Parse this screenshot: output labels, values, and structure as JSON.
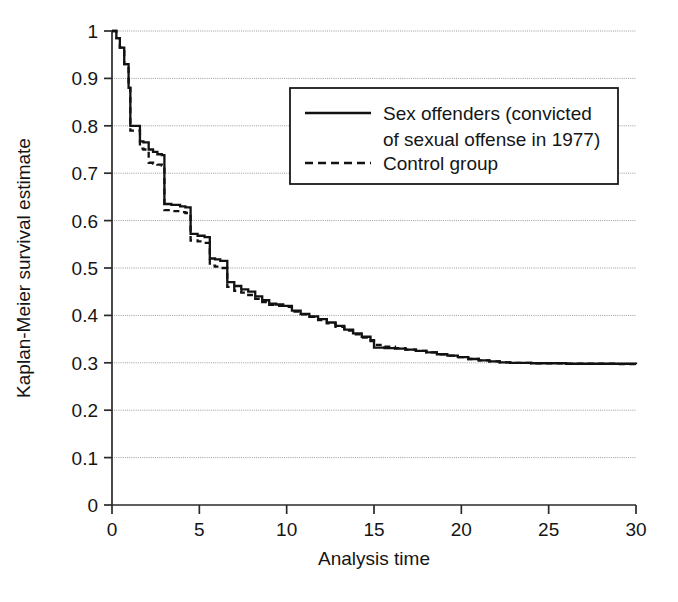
{
  "chart_data": {
    "type": "line",
    "title": "",
    "subtitle": "",
    "xlabel": "Analysis time",
    "ylabel": "Kaplan-Meier survival estimate",
    "xlim": [
      0,
      30
    ],
    "ylim": [
      0,
      1
    ],
    "xticks": [
      "0",
      "5",
      "10",
      "15",
      "20",
      "25",
      "30"
    ],
    "xtick_values": [
      0,
      5,
      10,
      15,
      20,
      25,
      30
    ],
    "yticks": [
      "0",
      "0.1",
      "0.2",
      "0.3",
      "0.4",
      "0.5",
      "0.6",
      "0.7",
      "0.8",
      "0.9",
      "1"
    ],
    "ytick_values": [
      0,
      0.1,
      0.2,
      0.3,
      0.4,
      0.5,
      0.6,
      0.7,
      0.8,
      0.9,
      1.0
    ],
    "grid": true,
    "grid_axis": "y",
    "legend_position": "upper-right-inside",
    "step_type": "post",
    "series": [
      {
        "name": "Sex offenders (convicted of sexual offense in 1977)",
        "style": "solid",
        "x": [
          0,
          0.25,
          0.45,
          0.7,
          0.95,
          1.05,
          1.6,
          1.8,
          2.1,
          2.35,
          2.6,
          2.85,
          3.0,
          3.4,
          3.9,
          4.2,
          4.5,
          4.9,
          5.3,
          5.6,
          5.9,
          6.2,
          6.6,
          7.0,
          7.4,
          7.8,
          8.2,
          8.6,
          9.0,
          9.4,
          9.8,
          10.3,
          10.8,
          11.3,
          11.8,
          12.3,
          12.8,
          13.3,
          13.8,
          14.3,
          14.8,
          15.0,
          15.6,
          16.2,
          16.8,
          17.4,
          18.0,
          18.6,
          19.2,
          19.8,
          20.4,
          21.0,
          21.6,
          22.2,
          22.8,
          23.4,
          24.0,
          25.0,
          26.0,
          27.0,
          28.0,
          29.0,
          30.0
        ],
        "y": [
          1.0,
          0.985,
          0.965,
          0.93,
          0.88,
          0.8,
          0.767,
          0.765,
          0.75,
          0.745,
          0.74,
          0.738,
          0.635,
          0.633,
          0.63,
          0.628,
          0.572,
          0.568,
          0.565,
          0.52,
          0.518,
          0.515,
          0.47,
          0.462,
          0.455,
          0.45,
          0.44,
          0.432,
          0.425,
          0.423,
          0.42,
          0.41,
          0.403,
          0.398,
          0.392,
          0.385,
          0.378,
          0.37,
          0.362,
          0.355,
          0.348,
          0.332,
          0.331,
          0.33,
          0.328,
          0.325,
          0.322,
          0.318,
          0.315,
          0.312,
          0.308,
          0.305,
          0.303,
          0.301,
          0.3,
          0.3,
          0.299,
          0.299,
          0.298,
          0.298,
          0.298,
          0.298,
          0.297
        ]
      },
      {
        "name": "Control group",
        "style": "dashed",
        "x": [
          0,
          0.25,
          0.45,
          0.7,
          0.95,
          1.05,
          1.6,
          1.8,
          2.1,
          2.35,
          2.6,
          2.85,
          3.0,
          3.4,
          3.9,
          4.2,
          4.5,
          4.9,
          5.3,
          5.6,
          5.9,
          6.2,
          6.6,
          7.0,
          7.4,
          7.8,
          8.2,
          8.6,
          9.0,
          9.4,
          9.8,
          10.3,
          10.8,
          11.3,
          11.8,
          12.3,
          12.8,
          13.3,
          13.8,
          14.3,
          14.8,
          15.0,
          15.6,
          16.2,
          16.8,
          17.4,
          18.0,
          18.6,
          19.2,
          19.8,
          20.4,
          21.0,
          21.6,
          22.2,
          22.8,
          23.4,
          24.0,
          25.0,
          26.0,
          27.0,
          28.0,
          29.0,
          30.0
        ],
        "y": [
          1.0,
          0.985,
          0.965,
          0.93,
          0.88,
          0.79,
          0.752,
          0.75,
          0.722,
          0.72,
          0.718,
          0.716,
          0.622,
          0.62,
          0.618,
          0.616,
          0.558,
          0.556,
          0.553,
          0.505,
          0.503,
          0.5,
          0.46,
          0.452,
          0.448,
          0.443,
          0.435,
          0.428,
          0.422,
          0.42,
          0.418,
          0.408,
          0.402,
          0.397,
          0.39,
          0.383,
          0.376,
          0.368,
          0.36,
          0.353,
          0.346,
          0.338,
          0.334,
          0.331,
          0.328,
          0.325,
          0.322,
          0.318,
          0.315,
          0.312,
          0.308,
          0.305,
          0.303,
          0.301,
          0.3,
          0.3,
          0.299,
          0.299,
          0.298,
          0.298,
          0.298,
          0.297,
          0.296
        ]
      }
    ]
  },
  "legend": {
    "entries": [
      {
        "label_line1": "Sex offenders (convicted",
        "label_line2": "of sexual offense in 1977)",
        "style": "solid"
      },
      {
        "label_line1": "Control group",
        "label_line2": "",
        "style": "dashed"
      }
    ]
  },
  "axes": {
    "x_title": "Analysis time",
    "y_title": "Kaplan-Meier survival estimate"
  }
}
